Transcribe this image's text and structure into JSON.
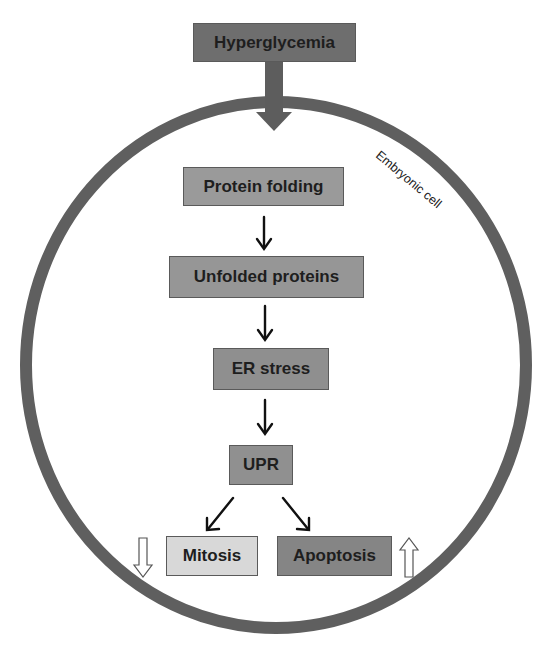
{
  "diagram": {
    "title_box": {
      "label": "Hyperglycemia",
      "color": "#6e6e6e"
    },
    "cell_label": "Embryonic cell",
    "cell_membrane_color": "#5f5f5f",
    "steps": [
      {
        "id": "protein-folding",
        "label": "Protein folding",
        "color": "#9a9a9a"
      },
      {
        "id": "unfolded-proteins",
        "label": "Unfolded proteins",
        "color": "#969696"
      },
      {
        "id": "er-stress",
        "label": "ER stress",
        "color": "#8f8f8f"
      },
      {
        "id": "upr",
        "label": "UPR",
        "color": "#909090"
      }
    ],
    "outcomes": [
      {
        "id": "mitosis",
        "label": "Mitosis",
        "color": "#d8d8d8",
        "trend": "decrease",
        "trend_icon": "down-arrow-outline"
      },
      {
        "id": "apoptosis",
        "label": "Apoptosis",
        "color": "#858585",
        "trend": "increase",
        "trend_icon": "up-arrow-outline"
      }
    ],
    "edges": [
      [
        "Hyperglycemia",
        "Protein folding"
      ],
      [
        "Protein folding",
        "Unfolded proteins"
      ],
      [
        "Unfolded proteins",
        "ER stress"
      ],
      [
        "ER stress",
        "UPR"
      ],
      [
        "UPR",
        "Mitosis"
      ],
      [
        "UPR",
        "Apoptosis"
      ]
    ]
  }
}
